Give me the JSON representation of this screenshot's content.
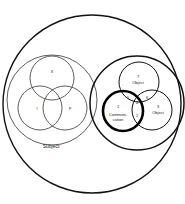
{
  "diagram": {
    "outer": {
      "label": ""
    },
    "subject_group": {
      "label": "Subject",
      "circles": [
        {
          "id": "top",
          "label": "II"
        },
        {
          "id": "left",
          "label": "I"
        },
        {
          "id": "right",
          "label": "P"
        }
      ]
    },
    "object_group": {
      "circles": [
        {
          "id": "top",
          "number": "7",
          "label": "Object"
        },
        {
          "id": "left",
          "number": "1",
          "label_line1": "Communi-",
          "label_line2": "cation"
        },
        {
          "id": "right",
          "number": "3",
          "label": "Object"
        }
      ],
      "intersections": [
        {
          "id": "left-top",
          "label": "5"
        },
        {
          "id": "center",
          "label": "4"
        },
        {
          "id": "right-top",
          "label": "6"
        },
        {
          "id": "left-right",
          "label": "2"
        }
      ]
    }
  },
  "colors": {
    "stroke": "#111111",
    "background": "#ffffff"
  }
}
